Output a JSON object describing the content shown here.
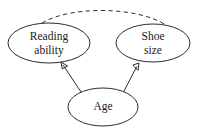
{
  "diagram": {
    "type": "causal-path-diagram",
    "title": "",
    "background_color": "#ffffff",
    "stroke_color": "#2b2b2b",
    "text_color": "#1a1a1a",
    "font_size_px": 11.5,
    "nodes": [
      {
        "id": "reading_ability",
        "label_lines": [
          "Reading",
          "ability"
        ],
        "label": "Reading ability",
        "shape": "ellipse",
        "cx": 49,
        "cy": 43,
        "rx": 41,
        "ry": 20
      },
      {
        "id": "shoe_size",
        "label_lines": [
          "Shoe",
          "size"
        ],
        "label": "Shoe size",
        "shape": "ellipse",
        "cx": 153,
        "cy": 43,
        "rx": 37,
        "ry": 19
      },
      {
        "id": "age",
        "label_lines": [
          "Age"
        ],
        "label": "Age",
        "shape": "ellipse",
        "cx": 103,
        "cy": 107,
        "rx": 35,
        "ry": 19
      }
    ],
    "edges": [
      {
        "id": "age-to-reading",
        "from": "age",
        "to": "reading_ability",
        "style": "solid",
        "arrow": "single",
        "x1": 81,
        "y1": 92,
        "x2": 61,
        "y2": 62
      },
      {
        "id": "age-to-shoe",
        "from": "age",
        "to": "shoe_size",
        "style": "solid",
        "arrow": "single",
        "x1": 123,
        "y1": 93,
        "x2": 139,
        "y2": 63
      },
      {
        "id": "reading-shoe-association",
        "from": "reading_ability",
        "to": "shoe_size",
        "style": "dashed",
        "arrow": "none",
        "path": "M 42,23 C 70,6 136,6 166,25"
      }
    ]
  }
}
